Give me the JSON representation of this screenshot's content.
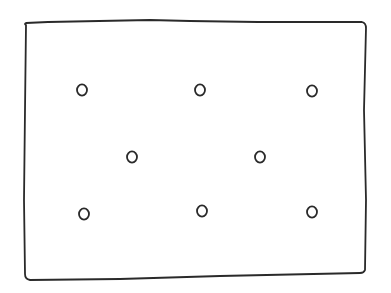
{
  "diagram": {
    "type": "hand-drawn sketch",
    "stroke_color": "#2a2a2a",
    "background": "#ffffff",
    "frame": {
      "shape": "rectangle",
      "points": [
        [
          24,
          24
        ],
        [
          150,
          20
        ],
        [
          365,
          22
        ],
        [
          366,
          272
        ],
        [
          26,
          280
        ]
      ]
    },
    "circles": [
      {
        "id": 1,
        "row": 1,
        "cx": 82,
        "cy": 90,
        "r": 5
      },
      {
        "id": 2,
        "row": 1,
        "cx": 200,
        "cy": 90,
        "r": 5
      },
      {
        "id": 3,
        "row": 1,
        "cx": 312,
        "cy": 91,
        "r": 5
      },
      {
        "id": 4,
        "row": 2,
        "cx": 132,
        "cy": 157,
        "r": 5
      },
      {
        "id": 5,
        "row": 2,
        "cx": 260,
        "cy": 157,
        "r": 5
      },
      {
        "id": 6,
        "row": 3,
        "cx": 84,
        "cy": 214,
        "r": 5
      },
      {
        "id": 7,
        "row": 3,
        "cx": 202,
        "cy": 211,
        "r": 5
      },
      {
        "id": 8,
        "row": 3,
        "cx": 312,
        "cy": 212,
        "r": 5
      }
    ]
  }
}
